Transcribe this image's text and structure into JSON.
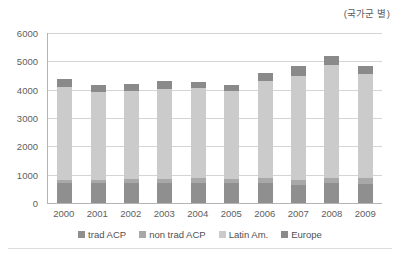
{
  "unit_note": "(국가군 별)",
  "chart_data": {
    "type": "bar",
    "subtype": "stacked-bar",
    "title": "",
    "subtitle": "",
    "annotation": "(국가군 별)",
    "xlabel": "",
    "ylabel": "",
    "ylim": [
      0,
      6000
    ],
    "ytick_step": 1000,
    "grid": true,
    "legend_position": "bottom",
    "categories": [
      "2000",
      "2001",
      "2002",
      "2003",
      "2004",
      "2005",
      "2006",
      "2007",
      "2008",
      "2009"
    ],
    "ytick_labels": [
      "0",
      "1000",
      "2000",
      "3000",
      "4000",
      "5000",
      "6000"
    ],
    "series": [
      {
        "name": "trad ACP",
        "color": "#8f8f8f",
        "values": [
          700,
          700,
          700,
          700,
          720,
          690,
          700,
          640,
          700,
          680
        ]
      },
      {
        "name": "non trad ACP",
        "color": "#a8a8a8",
        "values": [
          130,
          130,
          140,
          150,
          150,
          150,
          170,
          180,
          200,
          210
        ]
      },
      {
        "name": "Latin Am.",
        "color": "#cbcbcb",
        "values": [
          3250,
          3100,
          3110,
          3190,
          3180,
          3110,
          3450,
          3680,
          3980,
          3660
        ]
      },
      {
        "name": "Europe",
        "color": "#8a8a8a",
        "values": [
          300,
          250,
          250,
          280,
          230,
          220,
          280,
          350,
          300,
          270
        ]
      }
    ],
    "totals": [
      4380,
      4180,
      4200,
      4320,
      4280,
      4170,
      4600,
      4850,
      5180,
      4820
    ]
  },
  "legend": {
    "items": [
      {
        "label": "trad ACP",
        "color": "#8f8f8f"
      },
      {
        "label": "non trad ACP",
        "color": "#a8a8a8"
      },
      {
        "label": "Latin Am.",
        "color": "#cbcbcb"
      },
      {
        "label": "Europe",
        "color": "#8a8a8a"
      }
    ]
  }
}
